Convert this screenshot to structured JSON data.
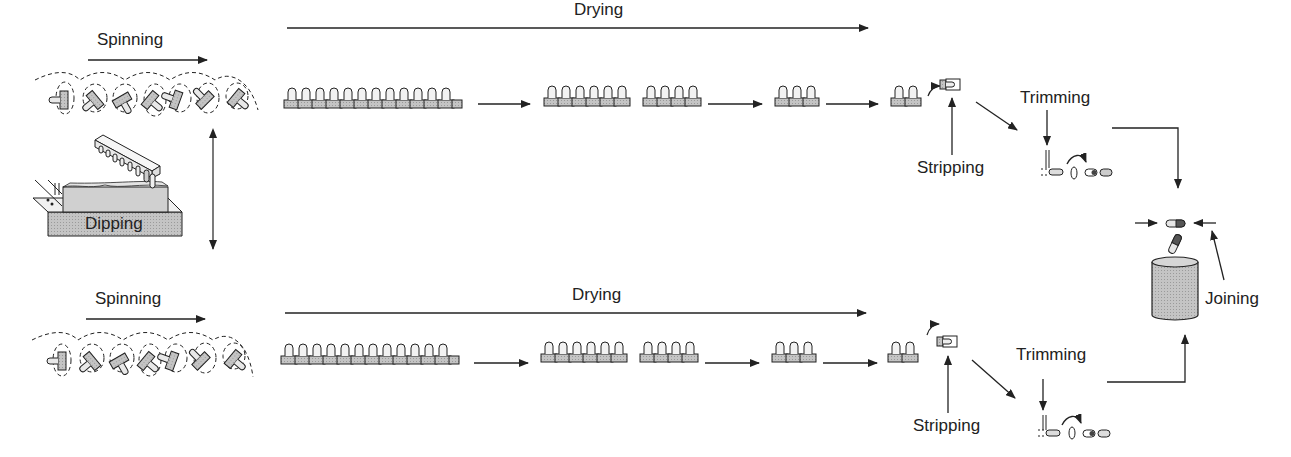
{
  "colors": {
    "stroke": "#222222",
    "fill": "#bdbdbd",
    "light": "#e6e6e6",
    "dark": "#555555"
  },
  "rows": [
    {
      "id": "cap",
      "spinning_label": "Spinning",
      "drying_label": "Drying",
      "stripping_label": "Stripping",
      "trimming_label": "Trimming",
      "pin_groups": [
        12,
        6,
        4,
        3,
        2
      ]
    },
    {
      "id": "body",
      "spinning_label": "Spinning",
      "drying_label": "Drying",
      "stripping_label": "Stripping",
      "trimming_label": "Trimming",
      "pin_groups": [
        12,
        6,
        4,
        3,
        2
      ]
    }
  ],
  "dipping_label": "Dipping",
  "joining_label": "Joining"
}
